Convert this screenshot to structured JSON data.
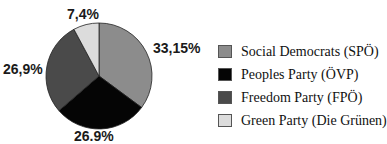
{
  "chart_data": {
    "type": "pie",
    "title": "",
    "categories": [
      "Social Democrats (SPÖ)",
      "Peoples Party (ÖVP)",
      "Freedom Party (FPÖ)",
      "Green Party (Die Grünen)"
    ],
    "values": [
      33.15,
      26.9,
      26.9,
      7.4
    ],
    "value_labels": [
      "33,15%",
      "26.9%",
      "26,9%",
      "7,4%"
    ],
    "colors": [
      "#8c8c8c",
      "#050505",
      "#4a4a4a",
      "#dcdcdc"
    ],
    "legend_position": "right",
    "start_angle_deg": 0,
    "direction": "clockwise"
  },
  "labels": {
    "spo": "33,15%",
    "ovp": "26.9%",
    "fpo": "26,9%",
    "green": "7,4%"
  },
  "legend": {
    "items": [
      {
        "label": "Social Democrats (SPÖ)",
        "color": "#8c8c8c"
      },
      {
        "label": "Peoples Party (ÖVP)",
        "color": "#050505"
      },
      {
        "label": "Freedom Party (FPÖ)",
        "color": "#4a4a4a"
      },
      {
        "label": "Green Party (Die Grünen)",
        "color": "#dcdcdc"
      }
    ]
  }
}
